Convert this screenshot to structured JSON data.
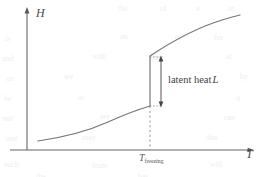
{
  "figure": {
    "background_color": "#ffffff",
    "ink_color": "#555555",
    "width": 262,
    "height": 177
  },
  "axes": {
    "y_label": "H",
    "x_label": "T",
    "origin_x": 27,
    "origin_y": 150,
    "y_top": 8,
    "x_right": 252
  },
  "annotations": {
    "tick_label": "T",
    "tick_subscript": "freezing",
    "latent_heat_text": "latent heat",
    "latent_heat_symbol": "L"
  },
  "chart_data": {
    "type": "line",
    "title": "",
    "xlabel": "T",
    "ylabel": "H",
    "grid": false,
    "legend": "none",
    "xlim": [
      0,
      1
    ],
    "ylim": [
      0,
      1
    ],
    "transition_x": 0.547,
    "discontinuity": {
      "y_lower": 0.31,
      "y_upper": 0.67,
      "magnitude": 0.36,
      "label": "latent heat L"
    },
    "series": [
      {
        "name": "solid branch",
        "comment": "lower branch, concave up, left of T_freezing",
        "points": [
          [
            0.049,
            0.063
          ],
          [
            0.14,
            0.098
          ],
          [
            0.24,
            0.137
          ],
          [
            0.34,
            0.18
          ],
          [
            0.43,
            0.227
          ],
          [
            0.5,
            0.273
          ],
          [
            0.547,
            0.31
          ]
        ]
      },
      {
        "name": "liquid branch",
        "comment": "upper branch, concave down, right of T_freezing",
        "points": [
          [
            0.547,
            0.67
          ],
          [
            0.62,
            0.73
          ],
          [
            0.7,
            0.79
          ],
          [
            0.79,
            0.848
          ],
          [
            0.88,
            0.896
          ],
          [
            0.947,
            0.925
          ]
        ]
      }
    ],
    "markers": [
      {
        "name": "tick",
        "x": 0.547,
        "y": 0.0,
        "style": "dashed-drop-line"
      }
    ],
    "arrows": [
      {
        "name": "latent-heat-arrow",
        "x": 0.6,
        "y_from": 0.31,
        "y_to": 0.67,
        "double_headed": true
      }
    ]
  },
  "bleed_text": [
    {
      "t": "the",
      "x": 118,
      "y": 4
    },
    {
      "t": "of",
      "x": 160,
      "y": 4
    },
    {
      "t": "a",
      "x": 196,
      "y": 4
    },
    {
      "t": "in",
      "x": 228,
      "y": 4
    },
    {
      "t": "is",
      "x": 5,
      "y": 34
    },
    {
      "t": "an",
      "x": 120,
      "y": 32
    },
    {
      "t": "to",
      "x": 175,
      "y": 33
    },
    {
      "t": "for",
      "x": 214,
      "y": 33
    },
    {
      "t": "and",
      "x": 2,
      "y": 54
    },
    {
      "t": "with",
      "x": 92,
      "y": 52
    },
    {
      "t": "that",
      "x": 150,
      "y": 53
    },
    {
      "t": "at",
      "x": 226,
      "y": 52
    },
    {
      "t": "on",
      "x": 6,
      "y": 74
    },
    {
      "t": "we",
      "x": 64,
      "y": 72
    },
    {
      "t": "by",
      "x": 240,
      "y": 72
    },
    {
      "t": "be",
      "x": 4,
      "y": 94
    },
    {
      "t": "as",
      "x": 78,
      "y": 93
    },
    {
      "t": "it",
      "x": 236,
      "y": 94
    },
    {
      "t": "not",
      "x": 3,
      "y": 114
    },
    {
      "t": "are",
      "x": 100,
      "y": 112
    },
    {
      "t": "can",
      "x": 224,
      "y": 113
    },
    {
      "t": "one",
      "x": 6,
      "y": 134
    },
    {
      "t": "may",
      "x": 82,
      "y": 133
    },
    {
      "t": "this",
      "x": 206,
      "y": 133
    },
    {
      "t": "such",
      "x": 4,
      "y": 160
    },
    {
      "t": "from",
      "x": 92,
      "y": 161
    },
    {
      "t": "will",
      "x": 210,
      "y": 160
    },
    {
      "t": "the",
      "x": 36,
      "y": 172
    },
    {
      "t": "has",
      "x": 138,
      "y": 172
    }
  ]
}
